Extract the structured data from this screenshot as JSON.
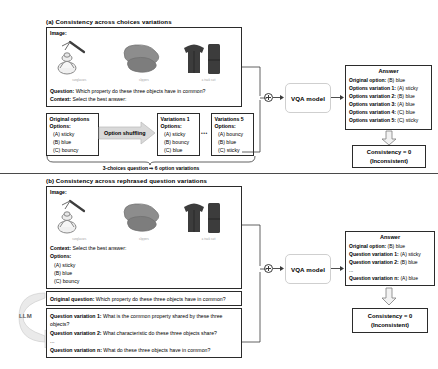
{
  "figure": {
    "sections": [
      {
        "id": "a",
        "title": "(a) Consistency across choices variations",
        "image_label": "Image:",
        "thumbnails": [
          {
            "name": "sunglasses-thumbnail",
            "caption": "sunglasses"
          },
          {
            "name": "slippers-thumbnail",
            "caption": "slippers"
          },
          {
            "name": "tracksuit-thumbnail",
            "caption": "a track suit"
          }
        ],
        "question_label": "Question:",
        "question_text": "Which property do these three objects have in common?",
        "context_label": "Context:",
        "context_text": "Select the best answer:",
        "option_boxes": [
          {
            "name": "original-options-box",
            "title": "Original options",
            "subtitle": "Options:",
            "options": [
              "(A) sticky",
              "(B) blue",
              "(C) bouncy"
            ]
          },
          {
            "name": "variations-1-box",
            "title": "Variations 1",
            "subtitle": "Options:",
            "options": [
              "(A) sticky",
              "(B) bouncy",
              "(C) blue"
            ]
          },
          {
            "name": "variations-5-box",
            "title": "Variations 5",
            "subtitle": "Options:",
            "options": [
              "(A) bouncy",
              "(B) blue",
              "(C) sticky"
            ]
          }
        ],
        "shuffle_label": "Option shuffling",
        "ellipsis": "•••",
        "footnote": "3-choices question ⇒ 6 option variations",
        "model_label": "VQA model",
        "merge_icon": "plus-circle-icon",
        "answer": {
          "title": "Answer",
          "lines": [
            {
              "label": "Original option:",
              "value": "(B) blue"
            },
            {
              "label": "Options variation 1:",
              "value": "(A) sticky"
            },
            {
              "label": "Options variation 2:",
              "value": "(B) blue"
            },
            {
              "label": "Options variation 3:",
              "value": "(A) blue"
            },
            {
              "label": "Options variation 4:",
              "value": "(C) blue"
            },
            {
              "label": "Options variation 5:",
              "value": "(C) sticky"
            }
          ]
        },
        "consistency": {
          "line1": "Consistency = 0",
          "line2": "(Inconsistent)"
        }
      },
      {
        "id": "b",
        "title": "(b) Consistency across rephrased question variations",
        "image_label": "Image:",
        "thumbnails": [
          {
            "name": "sunglasses-thumbnail",
            "caption": "sunglasses"
          },
          {
            "name": "slippers-thumbnail",
            "caption": "slippers"
          },
          {
            "name": "tracksuit-thumbnail",
            "caption": "a track suit"
          }
        ],
        "context_label": "Context:",
        "context_text": "Select the best answer:",
        "options_label": "Options:",
        "options": [
          "(A) sticky",
          "(B) blue",
          "(C) bouncy"
        ],
        "llm_label": "LLM",
        "original_question": {
          "label": "Original question:",
          "text": "Which property do these three objects have in common?"
        },
        "question_variations": [
          {
            "label": "Question variation 1:",
            "text": "What is the common property shared by these three objects?"
          },
          {
            "label": "Question variation 2:",
            "text": "What characteristic do these three objects share?"
          },
          {
            "label": "",
            "text": "..."
          },
          {
            "label": "Question variation n:",
            "text": "What do these three objects have in common?"
          }
        ],
        "model_label": "VQA model",
        "merge_icon": "plus-circle-icon",
        "answer": {
          "title": "Answer",
          "lines": [
            {
              "label": "Original option:",
              "value": "(B) blue"
            },
            {
              "label": "Question variation 1:",
              "value": "(A) sticky"
            },
            {
              "label": "Question variation 2:",
              "value": "(B) blue"
            },
            {
              "label": "",
              "value": "..."
            },
            {
              "label": "Question variation n:",
              "value": "(A) blue"
            }
          ]
        },
        "consistency": {
          "line1": "Consistency = 0",
          "line2": "(Inconsistent)"
        }
      }
    ],
    "colors": {
      "border": "#2b2b2b",
      "soft_border": "#cfcfcf",
      "arrow_fill": "#d9d9d9",
      "divider": "#4a4a4a"
    }
  }
}
